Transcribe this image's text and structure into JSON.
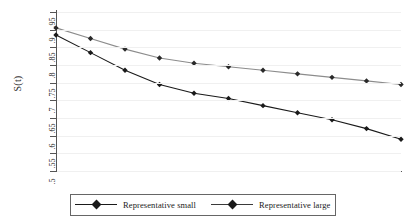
{
  "chart_data": {
    "type": "line",
    "title": "",
    "subtitle": "",
    "xlabel": "",
    "ylabel": "S(t)",
    "ylim": [
      0.5,
      0.95
    ],
    "xlim": [
      0,
      10
    ],
    "grid": true,
    "legend_position": "bottom",
    "ytick_labels": [
      ".95",
      ".9",
      ".85",
      ".8",
      ".75",
      ".7",
      ".65",
      ".6",
      ".55",
      ".5"
    ],
    "ytick_values": [
      0.95,
      0.9,
      0.85,
      0.8,
      0.75,
      0.7,
      0.65,
      0.6,
      0.55,
      0.5
    ],
    "xtick_labels": [],
    "x": [
      0,
      1,
      2,
      3,
      4,
      5,
      6,
      7,
      8,
      9,
      10
    ],
    "series": [
      {
        "name": "Representative small",
        "color": "#1a1a1a",
        "marker": "diamond",
        "values": [
          0.885,
          0.835,
          0.785,
          0.745,
          0.72,
          0.705,
          0.685,
          0.665,
          0.645,
          0.62,
          0.59
        ]
      },
      {
        "name": "Representative large",
        "color": "#8c8c8c",
        "marker": "diamond",
        "values": [
          0.905,
          0.875,
          0.845,
          0.82,
          0.805,
          0.795,
          0.785,
          0.775,
          0.765,
          0.755,
          0.745
        ]
      }
    ]
  },
  "axis": {
    "y_title": "S(t)"
  },
  "legend": {
    "entries": [
      {
        "label": "Representative small",
        "color": "#1a1a1a"
      },
      {
        "label": "Representative large",
        "color": "#3a3a3a"
      }
    ]
  }
}
